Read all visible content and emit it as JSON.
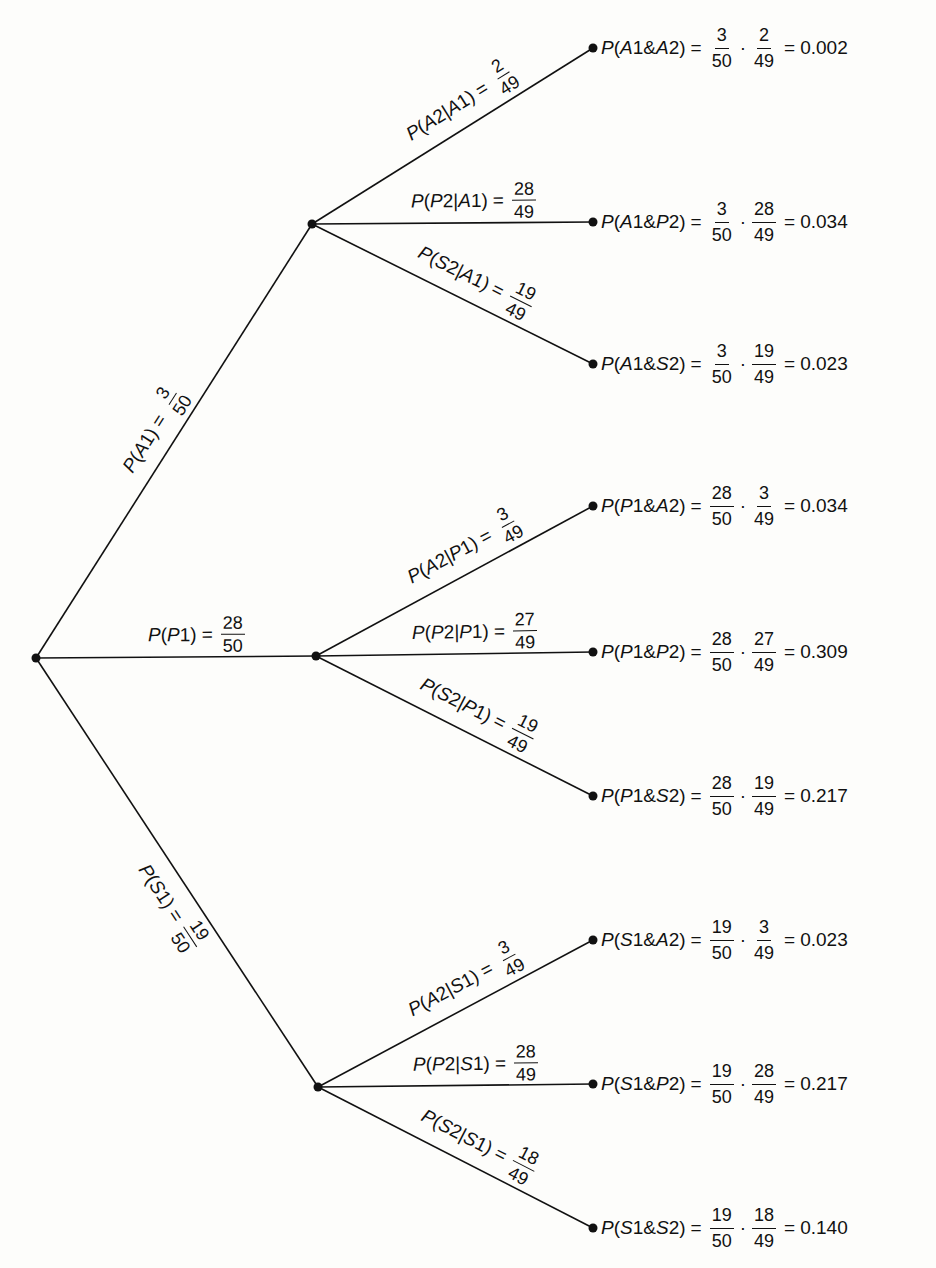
{
  "diagram": {
    "type": "probability-tree",
    "root": {
      "x": 36,
      "y": 658
    },
    "first_stage": [
      {
        "id": "A1",
        "label_event": "A1",
        "prob_num": "3",
        "prob_den": "50",
        "node": {
          "x": 312,
          "y": 224
        }
      },
      {
        "id": "P1",
        "label_event": "P1",
        "prob_num": "28",
        "prob_den": "50",
        "node": {
          "x": 316,
          "y": 656
        }
      },
      {
        "id": "S1",
        "label_event": "S1",
        "prob_num": "19",
        "prob_den": "50",
        "node": {
          "x": 318,
          "y": 1087
        }
      }
    ],
    "second_stage": [
      {
        "parent": "A1",
        "event": "A2",
        "given": "A1",
        "num": "2",
        "den": "49",
        "leaf_y": 48,
        "joint": "A1 & A2",
        "f1n": "3",
        "f1d": "50",
        "f2n": "2",
        "f2d": "49",
        "result": "0.002"
      },
      {
        "parent": "A1",
        "event": "P2",
        "given": "A1",
        "num": "28",
        "den": "49",
        "leaf_y": 222,
        "joint": "A1 & P2",
        "f1n": "3",
        "f1d": "50",
        "f2n": "28",
        "f2d": "49",
        "result": "0.034"
      },
      {
        "parent": "A1",
        "event": "S2",
        "given": "A1",
        "num": "19",
        "den": "49",
        "leaf_y": 364,
        "joint": "A1 & S2",
        "f1n": "3",
        "f1d": "50",
        "f2n": "19",
        "f2d": "49",
        "result": "0.023"
      },
      {
        "parent": "P1",
        "event": "A2",
        "given": "P1",
        "num": "3",
        "den": "49",
        "leaf_y": 506,
        "joint": "P1 & A2",
        "f1n": "28",
        "f1d": "50",
        "f2n": "3",
        "f2d": "49",
        "result": "0.034"
      },
      {
        "parent": "P1",
        "event": "P2",
        "given": "P1",
        "num": "27",
        "den": "49",
        "leaf_y": 652,
        "joint": "P1 & P2",
        "f1n": "28",
        "f1d": "50",
        "f2n": "27",
        "f2d": "49",
        "result": "0.309"
      },
      {
        "parent": "P1",
        "event": "S2",
        "given": "P1",
        "num": "19",
        "den": "49",
        "leaf_y": 796,
        "joint": "P1 & S2",
        "f1n": "28",
        "f1d": "50",
        "f2n": "19",
        "f2d": "49",
        "result": "0.217"
      },
      {
        "parent": "S1",
        "event": "A2",
        "given": "S1",
        "num": "3",
        "den": "49",
        "leaf_y": 940,
        "joint": "S1 & A2",
        "f1n": "19",
        "f1d": "50",
        "f2n": "3",
        "f2d": "49",
        "result": "0.023"
      },
      {
        "parent": "S1",
        "event": "P2",
        "given": "S1",
        "num": "28",
        "den": "49",
        "leaf_y": 1084,
        "joint": "S1 & P2",
        "f1n": "19",
        "f1d": "50",
        "f2n": "28",
        "f2d": "49",
        "result": "0.217"
      },
      {
        "parent": "S1",
        "event": "S2",
        "given": "S1",
        "num": "18",
        "den": "49",
        "leaf_y": 1228,
        "joint": "S1 & S2",
        "f1n": "19",
        "f1d": "50",
        "f2n": "18",
        "f2d": "49",
        "result": "0.140"
      }
    ],
    "leaf_x": 593,
    "colors": {
      "line": "#111111",
      "background": "#fdfdfb",
      "text": "#111111"
    }
  }
}
